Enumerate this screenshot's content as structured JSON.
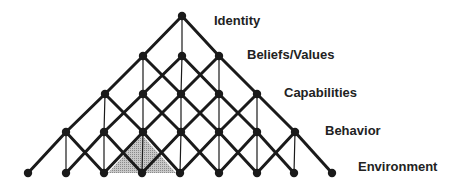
{
  "diagram": {
    "type": "neurological-levels-pyramid-lattice",
    "levels": [
      {
        "label": "Identity",
        "y": 16,
        "xs": [
          182
        ],
        "label_x": 214,
        "label_y": 14
      },
      {
        "label": "Beliefs/Values",
        "y": 56,
        "xs": [
          143,
          182,
          219
        ],
        "label_x": 247,
        "label_y": 48
      },
      {
        "label": "Capabilities",
        "y": 94,
        "xs": [
          105,
          143,
          181,
          219,
          257
        ],
        "label_x": 284,
        "label_y": 86
      },
      {
        "label": "Behavior",
        "y": 132,
        "xs": [
          66,
          104,
          143,
          181,
          219,
          257,
          295
        ],
        "label_x": 325,
        "label_y": 124
      },
      {
        "label": "Environment",
        "y": 173,
        "xs": [
          28,
          66,
          104,
          142,
          180,
          219,
          257,
          294,
          332
        ],
        "label_x": 358,
        "label_y": 160
      }
    ],
    "shaded_triangle": {
      "points": [
        [
          108,
          173
        ],
        [
          142,
          135
        ],
        [
          176,
          173
        ]
      ],
      "fill": "#a9a9a9"
    },
    "colors": {
      "line": "#1a1a1a",
      "node": "#1a1a1a",
      "text": "#222222"
    }
  }
}
